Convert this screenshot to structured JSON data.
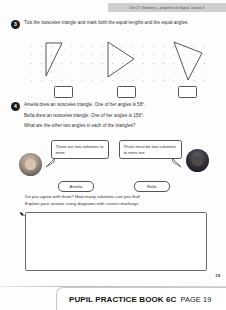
{
  "header": {
    "banner_text": "Unit 17: Geometry – properties of shapes, Lesson 3"
  },
  "questions": [
    {
      "number": "3",
      "text": "Tick the isosceles triangle and mark both the equal lengths and the equal angles."
    },
    {
      "number": "4",
      "line1": "Amelia drew an isosceles triangle. One of her angles is 58°.",
      "line2": "Bella drew an isosceles triangle. One of her angles is 156°.",
      "line3": "What are the other two angles in each of the triangles?"
    }
  ],
  "grid": {
    "triangles": [
      {
        "name": "triangle-right-scalene",
        "points": "22,4 22,37 38,4"
      },
      {
        "name": "triangle-isosceles-pointing-right",
        "points": "84,3 84,38 110,20"
      },
      {
        "name": "triangle-scalene-pointing-down",
        "points": "150,3 178,14 164,41"
      }
    ],
    "tick_boxes": [
      "",
      "",
      ""
    ]
  },
  "characters": {
    "amelia": {
      "name": "Amelia",
      "speech": "There are two solutions to mine."
    },
    "bella": {
      "name": "Bella",
      "speech": "There must be two solutions to mine too."
    }
  },
  "prompt": {
    "line1": "Do you agree with them? How many solutions can you find!",
    "line2": "Explain your answer using diagrams with correct markings."
  },
  "answer": {
    "value": ""
  },
  "page_number": "19",
  "footer": {
    "book_title": "PUPIL PRACTICE BOOK 6C",
    "page_label": "PAGE 19"
  }
}
